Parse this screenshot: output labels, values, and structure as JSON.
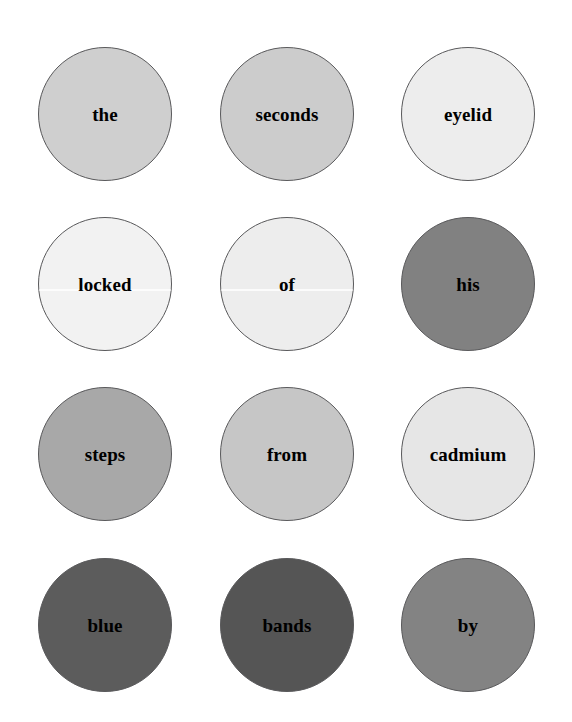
{
  "background_color": "#ffffff",
  "layout": {
    "columns": 3,
    "rows": 4,
    "circle_diameter_px": 134
  },
  "style": {
    "outline_color": "#59595b",
    "text_color": "#000000"
  },
  "bubbles": [
    {
      "label": "the",
      "fill": "#cfcfcf",
      "row": 0,
      "col": 0,
      "seam": false
    },
    {
      "label": "seconds",
      "fill": "#cccccc",
      "row": 0,
      "col": 1,
      "seam": false
    },
    {
      "label": "eyelid",
      "fill": "#ededed",
      "row": 0,
      "col": 2,
      "seam": false
    },
    {
      "label": "locked",
      "fill": "#f2f2f2",
      "row": 1,
      "col": 0,
      "seam": true
    },
    {
      "label": "of",
      "fill": "#ededed",
      "row": 1,
      "col": 1,
      "seam": true
    },
    {
      "label": "his",
      "fill": "#818181",
      "row": 1,
      "col": 2,
      "seam": false
    },
    {
      "label": "steps",
      "fill": "#a8a8a8",
      "row": 2,
      "col": 0,
      "seam": false
    },
    {
      "label": "from",
      "fill": "#c6c6c6",
      "row": 2,
      "col": 1,
      "seam": false
    },
    {
      "label": "cadmium",
      "fill": "#e6e6e6",
      "row": 2,
      "col": 2,
      "seam": false
    },
    {
      "label": "blue",
      "fill": "#5c5c5c",
      "row": 3,
      "col": 0,
      "seam": false
    },
    {
      "label": "bands",
      "fill": "#555555",
      "row": 3,
      "col": 1,
      "seam": false
    },
    {
      "label": "by",
      "fill": "#838383",
      "row": 3,
      "col": 2,
      "seam": false
    }
  ],
  "phrase": "the seconds eyelid locked of his steps from cadmium blue bands by"
}
